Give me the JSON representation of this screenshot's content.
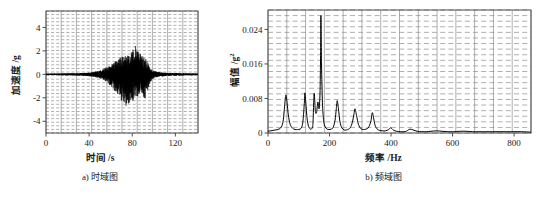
{
  "figure": {
    "panels": [
      {
        "id": "a",
        "caption": "a) 时域图",
        "xlabel": "时间 /s",
        "ylabel": "加速度 /g"
      },
      {
        "id": "b",
        "caption": "b) 频域图",
        "xlabel": "频率 /Hz",
        "ylabel_main": "幅值 /g",
        "ylabel_sup": "2"
      }
    ],
    "colors": {
      "line": "#000000",
      "grid": "#8c8c8c",
      "frame": "#4d4d4d",
      "background": "#ffffff"
    }
  },
  "chart_data": [
    {
      "type": "line",
      "id": "time-domain",
      "title": "a) 时域图",
      "xlabel": "时间 /s",
      "ylabel": "加速度 /g",
      "xlim": [
        0,
        141
      ],
      "ylim": [
        -5.0,
        5.4
      ],
      "xticks": [
        0,
        40,
        80,
        120
      ],
      "yticks": [
        -4,
        -2,
        0,
        2,
        4
      ],
      "xticklabels": [
        "0",
        "40",
        "80",
        "120"
      ],
      "yticklabels": [
        "-4",
        "-2",
        "0",
        "2",
        "4"
      ],
      "grid": true,
      "grid_style": "dashed-horizontal-and-vertical",
      "legend": null,
      "description": "Acceleration time history with low-amplitude background and a strong vibration burst between about 55 s and 100 s",
      "envelope": {
        "x": [
          0,
          5,
          10,
          15,
          20,
          25,
          30,
          35,
          40,
          45,
          48,
          50,
          52,
          55,
          58,
          60,
          62,
          64,
          66,
          68,
          70,
          72,
          74,
          76,
          78,
          80,
          82,
          83,
          84,
          85,
          86,
          88,
          90,
          92,
          94,
          96,
          98,
          100,
          103,
          106,
          110,
          115,
          120,
          125,
          130,
          135,
          141
        ],
        "upper": [
          0.06,
          0.07,
          0.07,
          0.08,
          0.09,
          0.09,
          0.1,
          0.12,
          0.15,
          0.22,
          0.3,
          0.35,
          0.42,
          0.55,
          0.75,
          0.9,
          1.0,
          1.15,
          1.25,
          1.35,
          1.5,
          1.5,
          1.6,
          1.75,
          1.85,
          2.0,
          2.3,
          2.5,
          2.45,
          2.2,
          2.0,
          1.85,
          1.7,
          1.5,
          1.1,
          0.7,
          0.45,
          0.3,
          0.22,
          0.18,
          0.15,
          0.12,
          0.1,
          0.09,
          0.08,
          0.07,
          0.07
        ],
        "lower": [
          -0.06,
          -0.07,
          -0.07,
          -0.08,
          -0.09,
          -0.09,
          -0.1,
          -0.12,
          -0.16,
          -0.24,
          -0.32,
          -0.38,
          -0.45,
          -0.6,
          -0.8,
          -1.0,
          -1.2,
          -1.45,
          -1.7,
          -1.95,
          -2.3,
          -2.55,
          -2.7,
          -2.65,
          -2.45,
          -2.3,
          -2.2,
          -2.15,
          -2.1,
          -2.0,
          -1.9,
          -1.85,
          -1.95,
          -2.1,
          -1.6,
          -0.9,
          -0.5,
          -0.32,
          -0.24,
          -0.2,
          -0.16,
          -0.13,
          -0.11,
          -0.1,
          -0.09,
          -0.08,
          -0.07
        ]
      }
    },
    {
      "type": "line",
      "id": "frequency-domain",
      "title": "b) 频域图",
      "xlabel": "频率 /Hz",
      "ylabel": "幅值 /g2",
      "xlim": [
        0,
        855
      ],
      "ylim": [
        0,
        0.0285
      ],
      "xticks": [
        0,
        200,
        400,
        600,
        800
      ],
      "yticks": [
        0,
        0.008,
        0.016,
        0.024
      ],
      "xticklabels": [
        "0",
        "200",
        "400",
        "600",
        "800"
      ],
      "yticklabels": [
        "0",
        "0.008",
        "0.016",
        "0.024"
      ],
      "grid": true,
      "grid_style": "dashed-horizontal-and-vertical",
      "legend": null,
      "description": "Amplitude spectrum dominated by a sharp peak near 172 Hz; further peaks near 58, 120, 150, 162, 225, 280 and 340 Hz",
      "peaks": [
        {
          "freq": 58,
          "amp": 0.0088
        },
        {
          "freq": 120,
          "amp": 0.0093
        },
        {
          "freq": 150,
          "amp": 0.0092
        },
        {
          "freq": 162,
          "amp": 0.0072
        },
        {
          "freq": 172,
          "amp": 0.0272
        },
        {
          "freq": 225,
          "amp": 0.0075
        },
        {
          "freq": 280,
          "amp": 0.0056
        },
        {
          "freq": 340,
          "amp": 0.0047
        },
        {
          "freq": 400,
          "amp": 0.0012
        },
        {
          "freq": 455,
          "amp": 0.0009
        },
        {
          "freq": 500,
          "amp": 0.0006
        }
      ],
      "x": [
        0,
        8,
        16,
        24,
        32,
        40,
        46,
        50,
        54,
        58,
        62,
        66,
        72,
        80,
        88,
        96,
        104,
        110,
        114,
        118,
        120,
        123,
        127,
        132,
        138,
        142,
        146,
        150,
        154,
        158,
        162,
        166,
        169,
        171,
        172,
        174,
        177,
        181,
        186,
        192,
        198,
        205,
        212,
        218,
        222,
        225,
        229,
        234,
        240,
        248,
        255,
        262,
        268,
        274,
        279,
        283,
        288,
        294,
        302,
        310,
        318,
        326,
        334,
        339,
        343,
        348,
        355,
        363,
        372,
        382,
        392,
        398,
        403,
        409,
        418,
        430,
        442,
        450,
        456,
        462,
        472,
        485,
        500,
        515,
        530,
        548,
        566,
        585,
        604,
        624,
        644,
        664,
        686,
        708,
        730,
        752,
        776,
        800,
        824,
        855
      ],
      "y": [
        0.0004,
        0.0005,
        0.0006,
        0.0007,
        0.0008,
        0.0011,
        0.0018,
        0.0032,
        0.0062,
        0.0088,
        0.007,
        0.0042,
        0.002,
        0.0011,
        0.0008,
        0.0008,
        0.0009,
        0.0014,
        0.003,
        0.0068,
        0.0093,
        0.007,
        0.0034,
        0.0015,
        0.0009,
        0.001,
        0.002,
        0.0092,
        0.005,
        0.0048,
        0.0072,
        0.0056,
        0.009,
        0.018,
        0.0272,
        0.016,
        0.007,
        0.0028,
        0.0014,
        0.0009,
        0.0008,
        0.0009,
        0.0013,
        0.003,
        0.0056,
        0.0075,
        0.0056,
        0.0026,
        0.0012,
        0.0007,
        0.0007,
        0.0009,
        0.0013,
        0.0024,
        0.0042,
        0.0056,
        0.004,
        0.002,
        0.001,
        0.0008,
        0.0009,
        0.0012,
        0.0026,
        0.0047,
        0.0036,
        0.0018,
        0.0009,
        0.0006,
        0.0005,
        0.0005,
        0.0008,
        0.0012,
        0.001,
        0.0006,
        0.0004,
        0.0003,
        0.0003,
        0.0004,
        0.0007,
        0.0009,
        0.0007,
        0.0004,
        0.0003,
        0.0003,
        0.0004,
        0.0005,
        0.0004,
        0.0003,
        0.0003,
        0.0004,
        0.0004,
        0.0003,
        0.0003,
        0.0003,
        0.0003,
        0.0003,
        0.0003,
        0.0003,
        0.0003,
        0.0002,
        0.0002
      ]
    }
  ]
}
